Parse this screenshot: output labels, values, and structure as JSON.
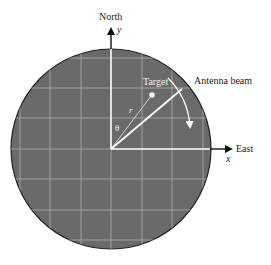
{
  "diagram": {
    "type": "radar-ppi-display",
    "labels": {
      "north": "North",
      "y_axis": "y",
      "east": "East",
      "x_axis": "x",
      "target": "Target",
      "antenna_beam": "Antenna beam",
      "range": "r",
      "angle": "θ"
    },
    "colors": {
      "scope_fill": "#6b6b6b",
      "grid": "#b5b5b5",
      "axes_inner": "#ffffff",
      "axes_outer": "#111111",
      "outline": "#222222",
      "text": "#222222"
    },
    "geometry": {
      "center": [
        111,
        149
      ],
      "radius": 100,
      "grid_x": [
        20,
        50,
        81,
        142,
        172,
        203
      ],
      "grid_y": [
        58,
        88,
        118,
        179,
        210,
        240
      ],
      "target_point": [
        152,
        95
      ],
      "beam_end": [
        182,
        89
      ]
    }
  }
}
